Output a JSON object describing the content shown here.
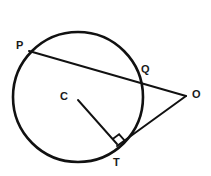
{
  "figure": {
    "background_color": "#ffffff",
    "stroke_color": "#111111",
    "label_color": "#1a1a1a"
  },
  "circle": {
    "name": "main-circle",
    "center_x": 78,
    "center_y": 97,
    "radius": 65,
    "stroke_width": 2.6,
    "fill": "none"
  },
  "points": {
    "center": {
      "label": "C",
      "x": 78,
      "y": 100,
      "label_x": 60,
      "label_y": 91
    },
    "p": {
      "label": "P",
      "x": 31,
      "y": 52,
      "label_x": 16,
      "label_y": 40
    },
    "q": {
      "label": "Q",
      "x": 140,
      "y": 79,
      "label_x": 141,
      "label_y": 64
    },
    "o": {
      "label": "O",
      "x": 185,
      "y": 96,
      "label_x": 192,
      "label_y": 89
    },
    "t": {
      "label": "T",
      "x": 118,
      "y": 145,
      "label_x": 113,
      "label_y": 157
    }
  },
  "segments": [
    {
      "name": "secant-line-po",
      "from": "P",
      "to": "O",
      "x1": 29,
      "y1": 51,
      "x2": 186,
      "y2": 96,
      "stroke_width": 2.0
    },
    {
      "name": "tangent-line-to",
      "from": "T",
      "to": "O",
      "x1": 117,
      "y1": 146,
      "x2": 186,
      "y2": 96,
      "stroke_width": 2.0
    },
    {
      "name": "radius-line-ct",
      "from": "C",
      "to": "T",
      "x1": 78,
      "y1": 100,
      "x2": 117,
      "y2": 144,
      "stroke_width": 1.9
    }
  ],
  "right_angle_marker": {
    "name": "right-angle-at-t",
    "at_point": "T",
    "size": 8,
    "stroke_width": 1.8
  }
}
